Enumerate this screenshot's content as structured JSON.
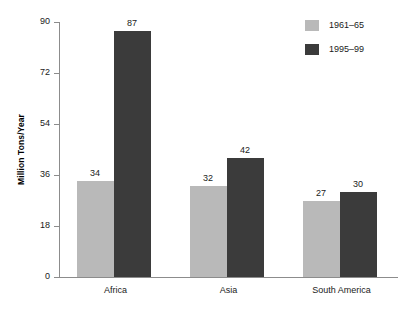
{
  "chart_data": {
    "type": "bar",
    "title": "",
    "subtitle": "",
    "xlabel": "",
    "ylabel": "Million Tons/Year",
    "categories": [
      "Africa",
      "Asia",
      "South America"
    ],
    "series": [
      {
        "name": "1961–65",
        "color": "#b9b9b9",
        "values": [
          34,
          32,
          27
        ]
      },
      {
        "name": "1995–99",
        "color": "#3b3b3b",
        "values": [
          87,
          42,
          30
        ]
      }
    ],
    "ylim": [
      0,
      90
    ],
    "yticks": [
      0,
      18,
      36,
      54,
      72,
      90
    ],
    "ytick_labels": [
      "0",
      "18",
      "36",
      "54",
      "72",
      "90"
    ],
    "grid": false,
    "legend_position": "top-right",
    "data_labels": [
      {
        "text": "34"
      },
      {
        "text": "87"
      },
      {
        "text": "32"
      },
      {
        "text": "42"
      },
      {
        "text": "27"
      },
      {
        "text": "30"
      }
    ],
    "background_color": "#ffffff",
    "axis_color": "#8c8c8c",
    "text_color": "#1a1a1a"
  },
  "legend": {
    "items": [
      {
        "label": "1961–65"
      },
      {
        "label": "1995–99"
      }
    ]
  }
}
